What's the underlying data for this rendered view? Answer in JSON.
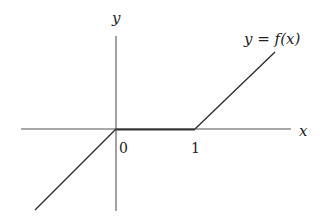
{
  "diagram": {
    "type": "function-graph",
    "axes": {
      "x_label": "x",
      "y_label": "y"
    },
    "ticks": {
      "origin_label": "0",
      "one_label": "1"
    },
    "curve_label": "y = f(x)",
    "function": {
      "description": "piecewise linear: f(x) = x for x < 0, f(x) = 0 for 0 <= x <= 1, f(x) = x - 1 for x > 1",
      "segments": [
        {
          "from": [
            -1,
            -1
          ],
          "to": [
            0,
            0
          ]
        },
        {
          "from": [
            0,
            0
          ],
          "to": [
            1,
            0
          ]
        },
        {
          "from": [
            1,
            0
          ],
          "to": [
            2,
            1
          ]
        }
      ]
    },
    "colors": {
      "axis": "#555555",
      "curve": "#2a2a2a",
      "background": "#ffffff"
    }
  }
}
